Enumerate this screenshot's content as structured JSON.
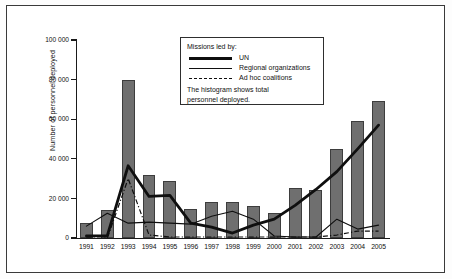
{
  "chart_data": {
    "type": "bar",
    "title": "",
    "xlabel": "",
    "ylabel": "Number of personnel deployed",
    "ylim": [
      0,
      100000
    ],
    "yticks": [
      0,
      20000,
      40000,
      60000,
      80000,
      100000
    ],
    "ytick_labels": [
      "0",
      "20 000",
      "40 000",
      "60 000",
      "80 000",
      "100 000"
    ],
    "grid": false,
    "legend_position": "top-center-inside",
    "categories": [
      "1991",
      "1992",
      "1993",
      "1994",
      "1995",
      "1996",
      "1997",
      "1998",
      "1999",
      "2000",
      "2001",
      "2002",
      "2003",
      "2004",
      "2005"
    ],
    "bars": {
      "name": "Total personnel deployed",
      "values": [
        7500,
        14000,
        80000,
        32000,
        29000,
        14500,
        18000,
        18000,
        16000,
        12500,
        25500,
        24500,
        45000,
        59000,
        69000
      ]
    },
    "series": [
      {
        "name": "UN",
        "style": "thick-solid",
        "values": [
          1000,
          1200,
          36500,
          21000,
          21500,
          7500,
          5500,
          2500,
          6500,
          9500,
          16500,
          24500,
          33500,
          45000,
          57000
        ]
      },
      {
        "name": "Regional organizations",
        "style": "thin-solid",
        "values": [
          6000,
          12500,
          7500,
          8000,
          7500,
          7000,
          11000,
          13500,
          9500,
          1000,
          500,
          500,
          9500,
          4500,
          6500
        ]
      },
      {
        "name": "Ad hoc coalitions",
        "style": "dash-dot",
        "values": [
          0,
          0,
          30000,
          1500,
          500,
          500,
          500,
          500,
          500,
          500,
          500,
          500,
          1500,
          3500,
          3500
        ]
      }
    ]
  },
  "legend": {
    "title": "Missions led by:",
    "entries": [
      {
        "label": "UN",
        "key": "thick-solid-line-key"
      },
      {
        "label": "Regional organizations",
        "key": "thin-solid-line-key"
      },
      {
        "label": "Ad hoc coalitions",
        "key": "dash-dot-line-key"
      }
    ],
    "note_line1": "The histogram shows total",
    "note_line2": "personnel deployed."
  },
  "colors": {
    "bar_fill": "#6f6f6f",
    "bar_stroke": "#3d3d3d",
    "line": "#0f0f0f",
    "frame": "#3a3a3a",
    "background": "#ffffff"
  }
}
